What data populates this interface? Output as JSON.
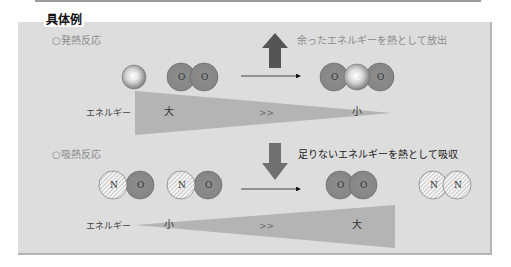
{
  "title": "具体例",
  "colors": {
    "panel_bg": "#dddddd",
    "atom_oxygen": "#8a8a8a",
    "atom_nitrogen_fill": "#f2f2f2",
    "arrow_dark": "#555555",
    "arrow_medium": "#707070",
    "triangle": "#b4b4b4"
  },
  "exothermic": {
    "heading": "○発熱反応",
    "description": "余ったエネルギーを熱として放出",
    "reactants": [
      {
        "molecule": "C",
        "atoms": [
          "C"
        ]
      },
      {
        "molecule": "O2",
        "atoms": [
          "O",
          "O"
        ]
      }
    ],
    "products": [
      {
        "molecule": "CO2",
        "atoms": [
          "O",
          "C",
          "O"
        ]
      }
    ],
    "heat_arrow": "up-arrow-icon",
    "energy_scale": {
      "label": "エネルギー",
      "left": "大",
      "middle": ">>",
      "right": "小"
    }
  },
  "endothermic": {
    "heading": "○吸熱反応",
    "description": "足りないエネルギーを熱として吸収",
    "reactants": [
      {
        "molecule": "NO",
        "atoms": [
          "N",
          "O"
        ]
      },
      {
        "molecule": "NO",
        "atoms": [
          "N",
          "O"
        ]
      }
    ],
    "products": [
      {
        "molecule": "O2",
        "atoms": [
          "O",
          "O"
        ]
      },
      {
        "molecule": "N2",
        "atoms": [
          "N",
          "N"
        ]
      }
    ],
    "heat_arrow": "down-arrow-icon",
    "energy_scale": {
      "label": "エネルギー",
      "left": "小",
      "middle": ">>",
      "right": "大"
    }
  }
}
